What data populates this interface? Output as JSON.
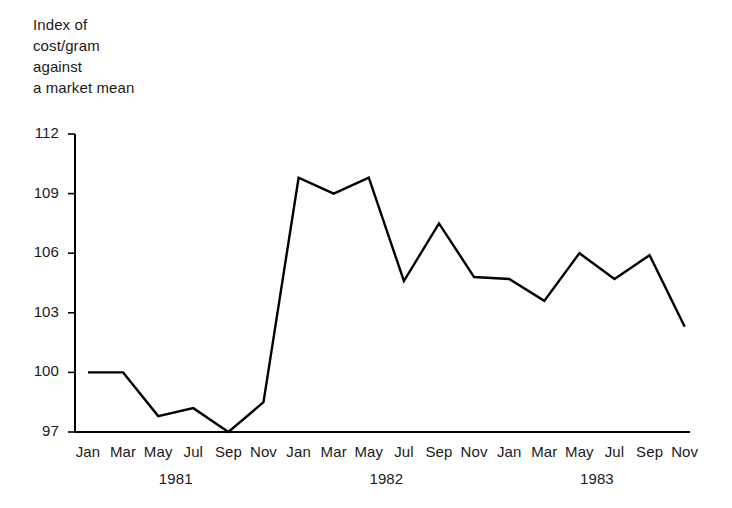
{
  "chart_data": {
    "type": "line",
    "title": "Index of\ncost/gram\nagainst\na market mean",
    "title_lines": [
      "Index of",
      "cost/gram",
      "against",
      "a market mean"
    ],
    "xlabel": "",
    "ylabel": "Index of cost/gram against a market mean",
    "ylim": [
      97,
      112
    ],
    "yticks": [
      112,
      109,
      106,
      103,
      100,
      97
    ],
    "ytick_labels": [
      "112",
      "109",
      "106",
      "103",
      "100",
      "97"
    ],
    "grid": false,
    "legend": "none",
    "x": [
      "Jan",
      "Mar",
      "May",
      "Jul",
      "Sep",
      "Nov",
      "Jan",
      "Mar",
      "May",
      "Jul",
      "Sep",
      "Nov",
      "Jan",
      "Mar",
      "May",
      "Jul",
      "Sep",
      "Nov"
    ],
    "xtick_labels": [
      "Jan",
      "Mar",
      "May",
      "Jul",
      "Sep",
      "Nov",
      "Jan",
      "Mar",
      "May",
      "Jul",
      "Sep",
      "Nov",
      "Jan",
      "Mar",
      "May",
      "Jul",
      "Sep",
      "Nov"
    ],
    "year_groups": [
      {
        "label": "1981",
        "start_index": 0,
        "end_index": 5
      },
      {
        "label": "1982",
        "start_index": 6,
        "end_index": 11
      },
      {
        "label": "1983",
        "start_index": 12,
        "end_index": 17
      }
    ],
    "values": [
      100.0,
      100.0,
      97.8,
      98.2,
      97.0,
      98.5,
      109.8,
      109.0,
      109.8,
      104.6,
      107.5,
      104.8,
      104.7,
      103.6,
      106.0,
      104.7,
      105.9,
      102.3
    ],
    "series": [
      {
        "name": "Index of cost/gram against a market mean",
        "color": "#000000",
        "values": [
          100.0,
          100.0,
          97.8,
          98.2,
          97.0,
          98.5,
          109.8,
          109.0,
          109.8,
          104.6,
          107.5,
          104.8,
          104.7,
          103.6,
          106.0,
          104.7,
          105.9,
          102.3
        ]
      }
    ],
    "line_color": "#000000",
    "line_width": 2.4,
    "axis_color": "#000000",
    "background": "#ffffff"
  }
}
